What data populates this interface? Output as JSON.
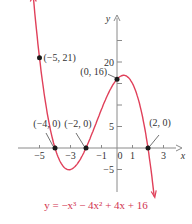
{
  "chart_data": {
    "type": "line",
    "title": "",
    "equation": "y = −x³ − 4x² + 4x + 16",
    "xlabel": "x",
    "ylabel": "y",
    "xlim": [
      -6.2,
      3.8
    ],
    "ylim": [
      -10.5,
      31
    ],
    "grid": false,
    "x_ticks": [
      -5,
      -4,
      -3,
      -2,
      -1,
      0,
      1,
      2,
      3
    ],
    "x_tick_labels": [
      {
        "value": -5,
        "label": "−5"
      },
      {
        "value": -3,
        "label": "−3"
      },
      {
        "value": -1,
        "label": "−1"
      },
      {
        "value": 0,
        "label": "0"
      },
      {
        "value": 1,
        "label": "1"
      },
      {
        "value": 3,
        "label": "3"
      }
    ],
    "y_ticks": [
      -5,
      5,
      10,
      15,
      20,
      25
    ],
    "y_tick_labels": [
      {
        "value": 20,
        "label": "20"
      },
      {
        "value": 5,
        "label": "5"
      },
      {
        "value": -5,
        "label": "−5"
      }
    ],
    "series": [
      {
        "name": "y = −x³ − 4x² + 4x + 16",
        "color": "#e0405a",
        "coefficients": [
          -1,
          -4,
          4,
          16
        ],
        "x_range": [
          -5.4,
          2.4
        ],
        "x": [
          -5.4,
          -5,
          -4.5,
          -4,
          -3.5,
          -3,
          -2.5,
          -2,
          -1.5,
          -1,
          -0.5,
          0,
          0.5,
          1,
          1.5,
          2,
          2.4
        ],
        "y": [
          26.94,
          21,
          12.38,
          0,
          -4.13,
          -5,
          -3.38,
          0,
          4.38,
          9,
          13.13,
          16,
          17.88,
          15,
          10.13,
          0,
          -7.36
        ]
      }
    ],
    "points": [
      {
        "x": -5,
        "y": 21,
        "label": "(−5, 21)"
      },
      {
        "x": 0,
        "y": 16,
        "label": "(0, 16)"
      },
      {
        "x": -4,
        "y": 0,
        "label": "(−4, 0)"
      },
      {
        "x": -2,
        "y": 0,
        "label": "(−2, 0)"
      },
      {
        "x": 2,
        "y": 0,
        "label": "(2, 0)"
      }
    ]
  },
  "colors": {
    "curve": "#e0405a",
    "axis": "#8a8a8a",
    "point": "#1a1a1a",
    "equation": "#d2344f"
  }
}
